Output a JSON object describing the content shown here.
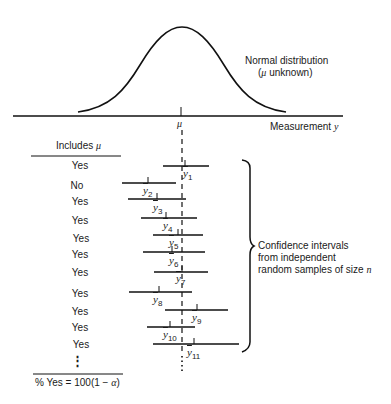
{
  "distribution": {
    "title_line1": "Normal distribution",
    "title_line2_prefix": "(",
    "title_line2_symbol": "μ",
    "title_line2_suffix": " unknown)"
  },
  "axis": {
    "mu_label": "μ",
    "measurement_label": "Measurement ",
    "measurement_var": "y"
  },
  "table": {
    "header_prefix": "Includes ",
    "header_symbol": "μ",
    "footer_prefix": "% Yes = 100(1 − ",
    "footer_symbol": "α",
    "footer_suffix": ")",
    "ellipsis": "⋮"
  },
  "brace_label": {
    "line1": "Confidence intervals",
    "line2": "from independent",
    "line3_prefix": "random samples of size ",
    "line3_var": "n"
  },
  "intervals": [
    {
      "includes": "Yes",
      "mean_label": "y",
      "sub": "1"
    },
    {
      "includes": "No",
      "mean_label": "y",
      "sub": "2"
    },
    {
      "includes": "Yes",
      "mean_label": "y",
      "sub": "3"
    },
    {
      "includes": "Yes",
      "mean_label": "y",
      "sub": "4"
    },
    {
      "includes": "Yes",
      "mean_label": "y",
      "sub": "5"
    },
    {
      "includes": "Yes",
      "mean_label": "y",
      "sub": "6"
    },
    {
      "includes": "Yes",
      "mean_label": "y",
      "sub": "7"
    },
    {
      "includes": "Yes",
      "mean_label": "y",
      "sub": "8"
    },
    {
      "includes": "Yes",
      "mean_label": "y",
      "sub": "9"
    },
    {
      "includes": "Yes",
      "mean_label": "y",
      "sub": "10"
    },
    {
      "includes": "Yes",
      "mean_label": "y",
      "sub": "11"
    }
  ]
}
